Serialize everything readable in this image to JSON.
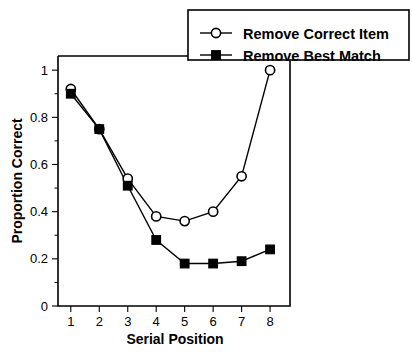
{
  "chart_data": {
    "type": "line",
    "title": "",
    "xlabel": "Serial Position",
    "ylabel": "Proportion Correct",
    "x": [
      1,
      2,
      3,
      4,
      5,
      6,
      7,
      8
    ],
    "categories": [
      "1",
      "2",
      "3",
      "4",
      "5",
      "6",
      "7",
      "8"
    ],
    "xtick_labels": [
      "1",
      "2",
      "3",
      "4",
      "5",
      "6",
      "7",
      "8"
    ],
    "ytick_labels": [
      "0",
      "0.2",
      "0.4",
      "0.6",
      "0.8",
      "1"
    ],
    "ytick_values": [
      0,
      0.2,
      0.4,
      0.6,
      0.8,
      1
    ],
    "xlim": [
      0.55,
      8.7
    ],
    "ylim": [
      0,
      1.06
    ],
    "grid": false,
    "legend_position": "top-right",
    "series": [
      {
        "name": "Remove Correct Item",
        "marker": "open-circle",
        "values": [
          0.92,
          0.75,
          0.54,
          0.38,
          0.36,
          0.4,
          0.55,
          1.0
        ]
      },
      {
        "name": "Remove Best Match",
        "marker": "filled-square",
        "values": [
          0.9,
          0.75,
          0.51,
          0.28,
          0.18,
          0.18,
          0.19,
          0.24
        ]
      }
    ]
  },
  "legend": {
    "entries": [
      {
        "label": "Remove Correct Item",
        "marker": "open-circle"
      },
      {
        "label": "Remove Best Match",
        "marker": "filled-square"
      }
    ]
  },
  "axes": {
    "y_title": "Proportion Correct",
    "x_title": "Serial Position"
  }
}
